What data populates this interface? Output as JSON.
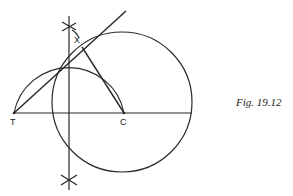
{
  "figure": {
    "caption": "Fig. 19.12",
    "points": {
      "T": {
        "label": "T",
        "x": 14,
        "y": 113
      },
      "C": {
        "label": "C",
        "x": 124,
        "y": 113
      },
      "X": {
        "label": "X",
        "x": 82,
        "y": 47
      }
    },
    "stroke_color": "#2a2a2a"
  }
}
